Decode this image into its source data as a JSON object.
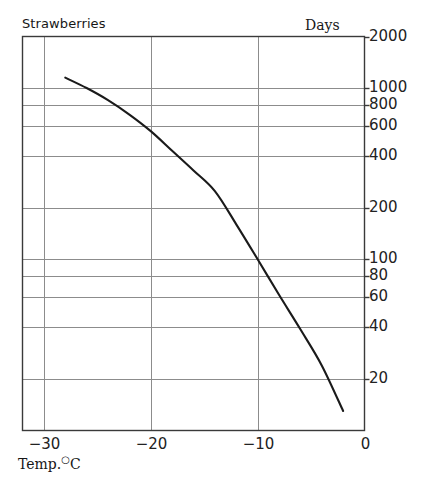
{
  "chart_data": {
    "type": "line",
    "title": "Strawberries",
    "subtitle": "",
    "xlabel": "Temp. °C",
    "ylabel": "Days",
    "xlim": [
      -32,
      0
    ],
    "ylim": [
      10,
      2000
    ],
    "yscale": "log",
    "xscale": "linear",
    "grid": true,
    "legend_position": "none",
    "x_ticks": [
      -30,
      -20,
      -10,
      0
    ],
    "x_tick_labels": [
      "−30",
      "−20",
      "−10",
      "0"
    ],
    "y_ticks": [
      2000,
      1000,
      800,
      600,
      400,
      200,
      100,
      80,
      60,
      40,
      20
    ],
    "y_tick_labels": [
      "2000",
      "1000",
      "800",
      "600",
      "400",
      "200",
      "100",
      "80",
      "60",
      "40",
      "20"
    ],
    "series": [
      {
        "name": "Strawberries",
        "x": [
          -28.0,
          -26.0,
          -24.0,
          -22.0,
          -20.0,
          -18.0,
          -16.0,
          -14.0,
          -12.0,
          -10.0,
          -8.0,
          -6.0,
          -4.0,
          -2.0
        ],
        "y": [
          1150,
          1000,
          850,
          700,
          560,
          430,
          330,
          250,
          160,
          100,
          62,
          39,
          24,
          13
        ]
      }
    ],
    "annotations": []
  },
  "labels": {
    "series_label": "Strawberries",
    "yaxis_unit": "Days",
    "xaxis_title_prefix": "Temp.",
    "xaxis_title_degree": "○",
    "xaxis_title_unit": "C"
  },
  "colors": {
    "curve": "#1a1a1a",
    "frame": "#3a3a3a",
    "gridline": "#8c8c8c",
    "background": "#ffffff",
    "text": "#1a1a1a"
  }
}
